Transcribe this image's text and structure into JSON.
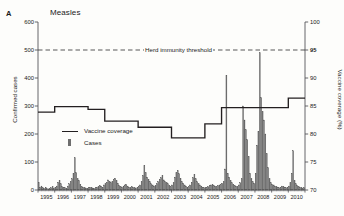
{
  "panel": {
    "letter": "A",
    "title": "Measles"
  },
  "axes": {
    "left": {
      "label": "Confirmed cases",
      "min": 0,
      "max": 600,
      "ticks": [
        0,
        100,
        200,
        300,
        400,
        500,
        600
      ],
      "tick_labels": [
        "0",
        "100",
        "200",
        "300",
        "400",
        "500",
        "600"
      ]
    },
    "right": {
      "label": "Vaccine coverage (%)",
      "min": 70,
      "max": 100,
      "ticks": [
        70,
        75,
        80,
        85,
        90,
        95,
        100
      ],
      "tick_labels": [
        "70",
        "75",
        "80",
        "85",
        "90",
        "95",
        "100"
      ],
      "bold_tick": "95"
    },
    "x": {
      "label": "",
      "tick_labels": [
        "1995",
        "1996",
        "1997",
        "1998",
        "1999",
        "2000",
        "2001",
        "2002",
        "2003",
        "2004",
        "2005",
        "2006",
        "2007",
        "2008",
        "2009",
        "2010"
      ]
    }
  },
  "annotations": {
    "threshold_label": "Herd immunity threshold",
    "threshold_value": 95
  },
  "legend": {
    "items": [
      {
        "label": "Vaccine coverage",
        "marker": "line",
        "color": "#231f20"
      },
      {
        "label": "Cases",
        "marker": "bar",
        "color": "#6e6e6e"
      }
    ]
  },
  "colors": {
    "bar": "#6e6e6e",
    "bar_edge": "#545454",
    "line": "#231f20",
    "axis": "#55555a",
    "threshold": "#3a3a3a",
    "background": "#fdfdfb"
  },
  "chart_data": {
    "type": "bar",
    "title": "Measles",
    "xlabel": "",
    "ylabel": "Confirmed cases",
    "y2label": "Vaccine coverage (%)",
    "ylim": [
      0,
      600
    ],
    "y2lim": [
      70,
      100
    ],
    "grid": false,
    "legend_position": "center-left",
    "x_tick_labels": [
      "1995",
      "1996",
      "1997",
      "1998",
      "1999",
      "2000",
      "2001",
      "2002",
      "2003",
      "2004",
      "2005",
      "2006",
      "2007",
      "2008",
      "2009",
      "2010"
    ],
    "series": [
      {
        "name": "Cases",
        "type": "bar",
        "axis": "left",
        "units": "confirmed cases per month",
        "x_start": "1995-01",
        "x_end": "2010-12",
        "values": [
          28,
          10,
          14,
          8,
          6,
          10,
          5,
          4,
          6,
          8,
          12,
          6,
          10,
          14,
          28,
          34,
          22,
          12,
          10,
          8,
          6,
          14,
          22,
          30,
          40,
          60,
          115,
          62,
          40,
          34,
          20,
          12,
          10,
          8,
          7,
          6,
          8,
          10,
          9,
          7,
          6,
          8,
          10,
          12,
          16,
          14,
          10,
          18,
          22,
          28,
          36,
          30,
          26,
          30,
          38,
          42,
          34,
          24,
          16,
          12,
          10,
          14,
          18,
          20,
          14,
          10,
          8,
          12,
          10,
          8,
          6,
          10,
          14,
          18,
          30,
          52,
          88,
          62,
          46,
          38,
          30,
          22,
          18,
          14,
          16,
          22,
          30,
          38,
          44,
          52,
          36,
          30,
          26,
          22,
          16,
          12,
          18,
          26,
          46,
          62,
          70,
          58,
          42,
          30,
          24,
          18,
          14,
          10,
          12,
          18,
          28,
          44,
          56,
          40,
          30,
          22,
          18,
          14,
          10,
          8,
          8,
          10,
          12,
          16,
          18,
          20,
          16,
          14,
          12,
          16,
          18,
          20,
          24,
          30,
          75,
          410,
          60,
          46,
          34,
          26,
          20,
          16,
          14,
          12,
          18,
          26,
          40,
          300,
          250,
          215,
          180,
          120,
          60,
          40,
          30,
          24,
          60,
          160,
          210,
          490,
          330,
          280,
          250,
          200,
          130,
          80,
          40,
          26,
          20,
          18,
          14,
          12,
          10,
          8,
          10,
          14,
          12,
          10,
          8,
          10,
          14,
          26,
          60,
          140,
          34,
          22,
          16,
          12,
          10,
          8,
          6,
          8
        ]
      },
      {
        "name": "Vaccine coverage",
        "type": "line",
        "axis": "right",
        "units": "%",
        "yearly_values": [
          {
            "year": 1995,
            "value": 83.9
          },
          {
            "year": 1996,
            "value": 84.9
          },
          {
            "year": 1997,
            "value": 84.9
          },
          {
            "year": 1998,
            "value": 84.4
          },
          {
            "year": 1999,
            "value": 82.3
          },
          {
            "year": 2000,
            "value": 82.3
          },
          {
            "year": 2001,
            "value": 81.2
          },
          {
            "year": 2002,
            "value": 81.2
          },
          {
            "year": 2003,
            "value": 79.3
          },
          {
            "year": 2004,
            "value": 79.3
          },
          {
            "year": 2005,
            "value": 81.8
          },
          {
            "year": 2006,
            "value": 84.7
          },
          {
            "year": 2007,
            "value": 84.7
          },
          {
            "year": 2008,
            "value": 84.7
          },
          {
            "year": 2009,
            "value": 84.7
          },
          {
            "year": 2010,
            "value": 86.4
          }
        ]
      }
    ],
    "reference_lines": [
      {
        "label": "Herd immunity threshold",
        "axis": "right",
        "value": 95,
        "style": "dashed"
      }
    ]
  }
}
